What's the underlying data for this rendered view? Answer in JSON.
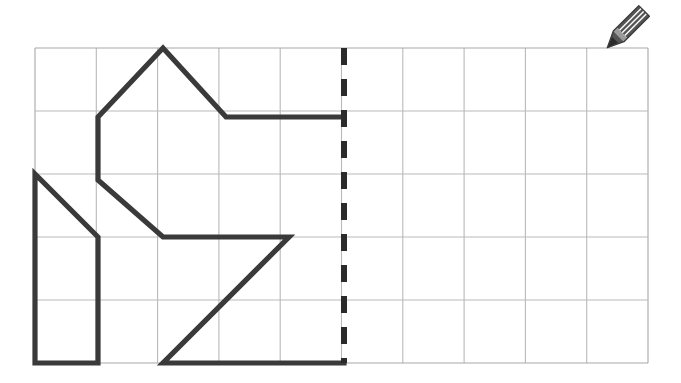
{
  "page": {
    "background_color": "#ffffff",
    "width": 681,
    "height": 383
  },
  "grid": {
    "name": "worksheet-grid",
    "origin_x": 35,
    "origin_y": 48,
    "cell_width": 61.3,
    "cell_height": 63,
    "columns": 10,
    "rows": 5,
    "line_color": "#b9b9b9",
    "line_width": 1.1,
    "border_color": "#a8a8a8"
  },
  "mirror_line": {
    "name": "line-of-symmetry",
    "column_index": 5,
    "x": 344,
    "y_top": 48,
    "y_bottom": 363,
    "color": "#2b2b2b",
    "stroke_width": 6,
    "dash_pattern": "17 14"
  },
  "figure": {
    "name": "half-figure-outline",
    "color": "#3a3a3a",
    "stroke_width": 5.2,
    "paths": [
      {
        "name": "main-outline-path",
        "points": [
          [
            344,
            363
          ],
          [
            163,
            363
          ],
          [
            289,
            237
          ],
          [
            163,
            237
          ],
          [
            98,
            180
          ],
          [
            98,
            117
          ],
          [
            163,
            48
          ],
          [
            226,
            117
          ],
          [
            344,
            117
          ]
        ]
      },
      {
        "name": "left-triangle-box-path",
        "points": [
          [
            98,
            363
          ],
          [
            35,
            363
          ],
          [
            35,
            174
          ],
          [
            98,
            237
          ],
          [
            98,
            363
          ]
        ]
      }
    ],
    "vertices_labels": [
      "bottom-right-at-mirror",
      "bottom-notch",
      "mid-right-point",
      "mid-left-step",
      "upper-left-step",
      "shoulder",
      "peak",
      "right-shoulder",
      "top-right-at-mirror"
    ]
  },
  "pencil": {
    "name": "pencil-icon",
    "x": 592,
    "y": 2,
    "width": 66,
    "height": 56,
    "body_color": "#555555",
    "stripe_color": "#ffffff",
    "tip_color": "#2a2a2a",
    "ferrule_color": "#9a9a9a",
    "rotation_deg": 45
  }
}
